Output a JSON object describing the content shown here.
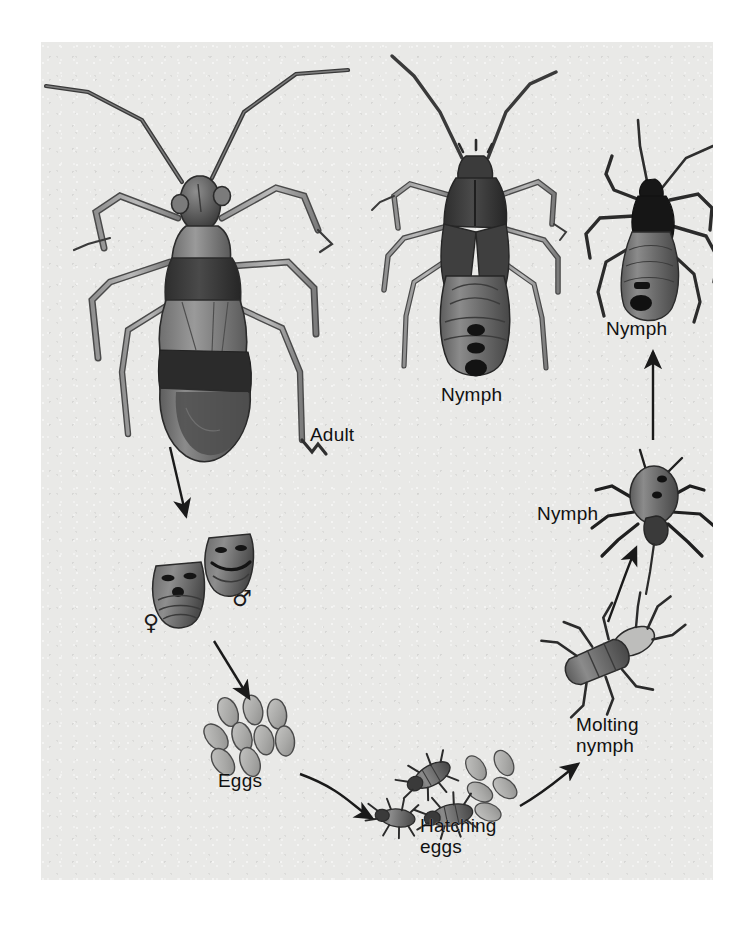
{
  "figure": {
    "background_color": "#ffffff",
    "plate_color": "#e9e9e7",
    "ink_color": "#1a1a1a"
  },
  "labels": {
    "adult": "Adult",
    "nymph_large": "Nymph",
    "nymph_small": "Nymph",
    "nymph_first_instar": "Nymph",
    "molting_nymph": "Molting\nnymph",
    "hatching_eggs": "Hatching\neggs",
    "eggs": "Eggs"
  },
  "symbols": {
    "female": "♀",
    "male": "♂"
  },
  "stages": [
    {
      "name": "adult",
      "label": "Adult"
    },
    {
      "name": "genitalia-female",
      "label": "♀"
    },
    {
      "name": "genitalia-male",
      "label": "♂"
    },
    {
      "name": "eggs",
      "label": "Eggs"
    },
    {
      "name": "hatching-eggs",
      "label": "Hatching eggs"
    },
    {
      "name": "molting-nymph",
      "label": "Molting nymph"
    },
    {
      "name": "nymph-first-instar",
      "label": "Nymph"
    },
    {
      "name": "nymph-small",
      "label": "Nymph"
    },
    {
      "name": "nymph-large",
      "label": "Nymph"
    }
  ],
  "arrows": [
    {
      "from": "adult",
      "to": "genitalia"
    },
    {
      "from": "genitalia",
      "to": "eggs"
    },
    {
      "from": "eggs",
      "to": "hatching-eggs"
    },
    {
      "from": "hatching-eggs",
      "to": "molting-nymph"
    },
    {
      "from": "molting-nymph",
      "to": "nymph-first-instar"
    },
    {
      "from": "nymph-first-instar",
      "to": "nymph-small"
    }
  ]
}
